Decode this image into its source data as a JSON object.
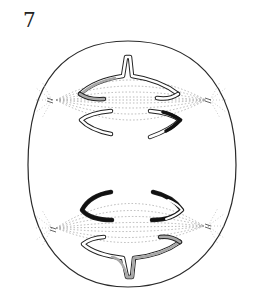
{
  "figure": {
    "label": "7",
    "colors": {
      "outline": "#2a2a2a",
      "fiber": "#9a9a9a",
      "chromatid_dark": "#111111",
      "chromatid_gray": "#a8a8a8",
      "chromatid_white": "#ffffff"
    },
    "spindles": [
      {
        "name": "upper-spindle",
        "left_pole": [
          52,
          100
        ],
        "right_pole": [
          210,
          100
        ]
      },
      {
        "name": "lower-spindle",
        "left_pole": [
          52,
          228
        ],
        "right_pole": [
          208,
          226
        ]
      }
    ]
  }
}
